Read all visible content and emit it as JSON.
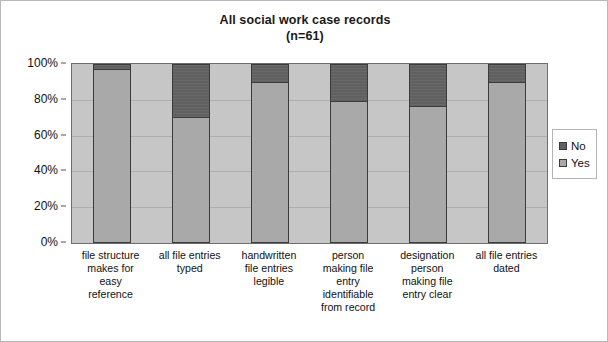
{
  "chart_data": {
    "type": "bar",
    "stacked": true,
    "percent_stacked": true,
    "title": "All social work case records",
    "subtitle": "(n=61)",
    "xlabel": "",
    "ylabel": "",
    "ylim": [
      0,
      100
    ],
    "ytick_labels": [
      "100%",
      "80%",
      "60%",
      "40%",
      "20%",
      "0%"
    ],
    "ytick_values": [
      100,
      80,
      60,
      40,
      20,
      0
    ],
    "grid": true,
    "legend_position": "right",
    "categories": [
      "file structure makes for easy reference",
      "all file entries typed",
      "handwritten file entries legible",
      "person making file entry identifiable from record",
      "designation person making file entry clear",
      "all file entries dated"
    ],
    "category_label_lines": [
      [
        "file structure",
        "makes for",
        "easy",
        "reference"
      ],
      [
        "all file entries",
        "typed"
      ],
      [
        "handwritten",
        "file entries",
        "legible"
      ],
      [
        "person",
        "making file",
        "entry",
        "identifiable",
        "from record"
      ],
      [
        "designation",
        "person",
        "making file",
        "entry clear"
      ],
      [
        "all file entries",
        "dated"
      ]
    ],
    "series": [
      {
        "name": "Yes",
        "color": "#a9a9a9",
        "values": [
          97,
          70,
          90,
          79,
          76,
          90
        ]
      },
      {
        "name": "No",
        "color": "#606060",
        "values": [
          3,
          30,
          10,
          21,
          24,
          10
        ]
      }
    ]
  },
  "legend": {
    "items": [
      {
        "label": "No",
        "color": "#606060"
      },
      {
        "label": "Yes",
        "color": "#a9a9a9"
      }
    ]
  },
  "colors": {
    "plot_background": "#c6c6c6",
    "gridline": "#aeaeae",
    "bar_border": "#3b3b3b",
    "frame_border": "#b8b8b8",
    "text": "#111111"
  }
}
